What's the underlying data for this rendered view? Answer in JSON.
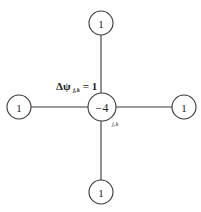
{
  "diagram": {
    "type": "five-point-stencil",
    "center_node": {
      "value": "−4",
      "subscript": "j,k"
    },
    "neighbors": {
      "top": {
        "value": "1"
      },
      "bottom": {
        "value": "1"
      },
      "left": {
        "value": "1"
      },
      "right": {
        "value": "1"
      }
    },
    "label": {
      "prefix": "Δψ",
      "subscript": "j,k",
      "suffix": " = 1"
    }
  }
}
